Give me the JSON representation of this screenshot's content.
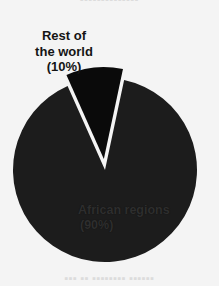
{
  "page": {
    "background_color": "#f4f4f4",
    "width": 219,
    "height": 286
  },
  "bleed_text": {
    "top": "▪▪▪▪▪▪▪▪▪▪▪▪▪▪",
    "bottom": "▪▪▪  ▪▪  ▪▪▪▪▪▪▪▪  ▪▪▪▪▪▪"
  },
  "labels": {
    "rest_of_world": {
      "name": "Rest of\nthe world",
      "percent_text": "(10%)",
      "full_text": "Rest of\nthe world\n(10%)",
      "color": "#141414"
    },
    "african_regions": {
      "name": "African regions",
      "percent_text": "(90%)",
      "color": "#2e2e2e"
    }
  },
  "chart_data": {
    "type": "pie",
    "title": "",
    "subtitle": "",
    "xlabel": "",
    "ylabel": "",
    "legend_position": "none",
    "grid": false,
    "units": "percent",
    "start_angle_deg": 12,
    "direction": "clockwise",
    "center": {
      "x": 105,
      "y": 170
    },
    "radius": 92,
    "categories": [
      "African regions",
      "Rest of the world"
    ],
    "values": [
      90,
      10
    ],
    "labels": [
      "African regions\n(90%)",
      "Rest of\nthe world\n(10%)"
    ],
    "colors": [
      "#1c1c1c",
      "#0a0a0a"
    ],
    "exploded": [
      false,
      true
    ],
    "explode_offset": 11,
    "slices": [
      {
        "label": "African regions",
        "value": 90,
        "percent": "90%",
        "percent_label": "(90%)",
        "color": "#1c1c1c",
        "exploded": false,
        "start_angle_deg": 12,
        "end_angle_deg": 336,
        "sweep_deg": 324,
        "label_color": "#2e2e2e"
      },
      {
        "label": "Rest of the world",
        "value": 10,
        "percent": "10%",
        "percent_label": "(10%)",
        "color": "#0a0a0a",
        "exploded": true,
        "start_angle_deg": 336,
        "end_angle_deg": 372,
        "sweep_deg": 36,
        "label_color": "#141414"
      }
    ]
  }
}
